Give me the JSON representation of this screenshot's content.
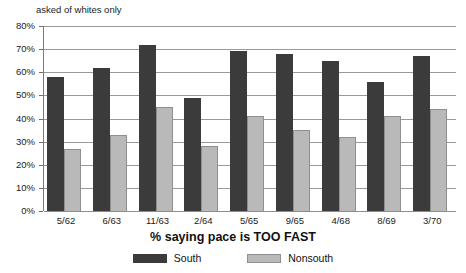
{
  "annotation": "asked of whites only",
  "caption": "% saying pace is TOO FAST",
  "legend": {
    "items": [
      {
        "label": "South",
        "color": "#3b3b3b",
        "swatch": "south-swatch"
      },
      {
        "label": "Nonsouth",
        "color": "#b9b9b9",
        "swatch": "nonsouth-swatch"
      }
    ]
  },
  "axis": {
    "y_ticks": [
      "0%",
      "10%",
      "20%",
      "30%",
      "40%",
      "50%",
      "60%",
      "70%",
      "80%"
    ]
  },
  "chart_data": {
    "type": "bar",
    "title": "% saying pace is TOO FAST",
    "subtitle": "asked of whites only",
    "xlabel": "",
    "ylabel": "",
    "ylim": [
      0,
      80
    ],
    "ytick_step": 10,
    "grid": true,
    "legend_position": "bottom",
    "categories": [
      "5/62",
      "6/63",
      "11/63",
      "2/64",
      "5/65",
      "9/65",
      "4/68",
      "8/69",
      "3/70"
    ],
    "series": [
      {
        "name": "South",
        "color": "#3b3b3b",
        "values": [
          58,
          62,
          72,
          49,
          69,
          68,
          65,
          56,
          67
        ]
      },
      {
        "name": "Nonsouth",
        "color": "#b9b9b9",
        "values": [
          27,
          33,
          45,
          28,
          41,
          35,
          32,
          41,
          44
        ]
      }
    ]
  }
}
